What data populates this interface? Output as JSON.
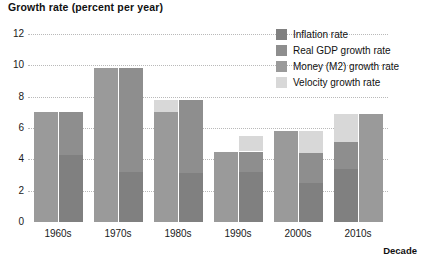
{
  "chart_data": {
    "type": "bar",
    "title": "Growth rate (percent per year)",
    "xlabel": "Decade",
    "ylabel": "Growth rate (percent per year)",
    "ylim": [
      0,
      12
    ],
    "yticks": [
      0,
      2,
      4,
      6,
      8,
      10,
      12
    ],
    "ytick_labels": [
      "0",
      "2",
      "4",
      "6",
      "8",
      "10",
      "12"
    ],
    "grid": true,
    "legend_position": "top-right",
    "categories": [
      "1960s",
      "1970s",
      "1980s",
      "1990s",
      "2000s",
      "2010s"
    ],
    "series": [
      {
        "name": "Money (M2) growth rate",
        "values": [
          7.0,
          9.8,
          7.0,
          5.5,
          5.8,
          6.9
        ]
      },
      {
        "name": "Velocity growth rate",
        "values": [
          0.0,
          0.0,
          0.8,
          1.0,
          1.4,
          1.8
        ]
      },
      {
        "name": "Inflation rate",
        "values": [
          4.3,
          3.2,
          3.1,
          3.2,
          2.5,
          3.4
        ]
      },
      {
        "name": "Real GDP growth rate",
        "values": [
          2.7,
          6.6,
          4.7,
          1.3,
          1.9,
          1.7
        ]
      }
    ],
    "bar_pairs": [
      {
        "category": "1960s",
        "left_stack": [
          {
            "series": "Money (M2) growth rate",
            "from": 0.0,
            "to": 7.0
          }
        ],
        "right_stack": [
          {
            "series": "Inflation rate",
            "from": 0.0,
            "to": 4.3
          },
          {
            "series": "Real GDP growth rate",
            "from": 4.3,
            "to": 7.0
          }
        ]
      },
      {
        "category": "1970s",
        "left_stack": [
          {
            "series": "Money (M2) growth rate",
            "from": 0.0,
            "to": 9.8
          }
        ],
        "right_stack": [
          {
            "series": "Inflation rate",
            "from": 0.0,
            "to": 3.2
          },
          {
            "series": "Real GDP growth rate",
            "from": 3.2,
            "to": 9.8
          }
        ]
      },
      {
        "category": "1980s",
        "left_stack": [
          {
            "series": "Money (M2) growth rate",
            "from": 0.0,
            "to": 7.0
          },
          {
            "series": "Velocity growth rate",
            "from": 7.0,
            "to": 7.8
          }
        ],
        "right_stack": [
          {
            "series": "Inflation rate",
            "from": 0.0,
            "to": 3.1
          },
          {
            "series": "Real GDP growth rate",
            "from": 3.1,
            "to": 7.8
          }
        ]
      },
      {
        "category": "1990s",
        "left_stack": [
          {
            "series": "Money (M2) growth rate",
            "from": 0.0,
            "to": 4.5
          }
        ],
        "right_stack": [
          {
            "series": "Inflation rate",
            "from": 0.0,
            "to": 3.2
          },
          {
            "series": "Real GDP growth rate",
            "from": 3.2,
            "to": 4.5
          },
          {
            "series": "Velocity growth rate",
            "from": 4.5,
            "to": 5.5
          }
        ]
      },
      {
        "category": "2000s",
        "left_stack": [
          {
            "series": "Money (M2) growth rate",
            "from": 0.0,
            "to": 5.8
          }
        ],
        "right_stack": [
          {
            "series": "Inflation rate",
            "from": 0.0,
            "to": 2.5
          },
          {
            "series": "Real GDP growth rate",
            "from": 2.5,
            "to": 4.4
          },
          {
            "series": "Velocity growth rate",
            "from": 4.4,
            "to": 5.8
          }
        ]
      },
      {
        "category": "2010s",
        "left_stack": [
          {
            "series": "Inflation rate",
            "from": 0.0,
            "to": 3.4
          },
          {
            "series": "Real GDP growth rate",
            "from": 3.4,
            "to": 5.1
          },
          {
            "series": "Velocity growth rate",
            "from": 5.1,
            "to": 6.9
          }
        ],
        "right_stack": [
          {
            "series": "Money (M2) growth rate",
            "from": 0.0,
            "to": 6.9
          }
        ]
      }
    ]
  },
  "legend": {
    "items": [
      {
        "label": "Inflation rate",
        "color": "#808080"
      },
      {
        "label": "Real GDP growth rate",
        "color": "#8e8e8e"
      },
      {
        "label": "Money (M2) growth rate",
        "color": "#9a9a9a"
      },
      {
        "label": "Velocity growth rate",
        "color": "#d8d8d8"
      }
    ]
  },
  "colors": {
    "inflation": "#808080",
    "real_gdp": "#8e8e8e",
    "money_m2": "#9a9a9a",
    "velocity": "#d8d8d8",
    "gridline": "#b9b9b9",
    "text": "#1a1a1a",
    "background": "#ffffff"
  }
}
